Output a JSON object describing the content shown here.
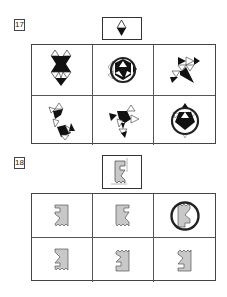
{
  "questions": [
    {
      "number": "17",
      "prompt_figure": "diamond-white-over-black-triangle-icon",
      "options": [
        {
          "index": 1,
          "figure": "hourglass-triangles-icon",
          "selected": false
        },
        {
          "index": 2,
          "figure": "circled-triangle-hexagon-icon",
          "selected": true
        },
        {
          "index": 3,
          "figure": "pinwheel-triangles-icon",
          "selected": false
        },
        {
          "index": 4,
          "figure": "l-shape-triangles-icon",
          "selected": false
        },
        {
          "index": 5,
          "figure": "fish-triangles-icon",
          "selected": false
        },
        {
          "index": 6,
          "figure": "circled-pentagon-triangles-icon",
          "selected": true
        }
      ]
    },
    {
      "number": "18",
      "prompt_figure": "castle-notch-shape-icon",
      "options": [
        {
          "index": 1,
          "figure": "castle-shape-mirrored-icon",
          "selected": false
        },
        {
          "index": 2,
          "figure": "castle-shape-icon",
          "selected": false
        },
        {
          "index": 3,
          "figure": "castle-shape-rotated-icon",
          "selected": true
        },
        {
          "index": 4,
          "figure": "castle-shape-flipped-icon",
          "selected": false
        },
        {
          "index": 5,
          "figure": "castle-shape-upside-icon",
          "selected": false
        },
        {
          "index": 6,
          "figure": "castle-shape-upside-mirrored-icon",
          "selected": false
        }
      ]
    }
  ],
  "colors": {
    "shape_fill_dark": "#111111",
    "shape_fill_gray": "#c8c8c8",
    "line": "#444444"
  }
}
